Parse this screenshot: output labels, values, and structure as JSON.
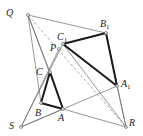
{
  "diagram": {
    "points": {
      "Q": {
        "label": "Q",
        "sub": "",
        "x": 28,
        "y": 15,
        "lx": 6,
        "ly": 16
      },
      "P": {
        "label": "P",
        "sub": "",
        "x": 59,
        "y": 49,
        "lx": 50,
        "ly": 51
      },
      "C1": {
        "label": "C",
        "sub": "1",
        "x": 63,
        "y": 44,
        "lx": 57,
        "ly": 40
      },
      "B1": {
        "label": "B",
        "sub": "1",
        "x": 106,
        "y": 33,
        "lx": 100,
        "ly": 27
      },
      "A1": {
        "label": "A",
        "sub": "1",
        "x": 117,
        "y": 86,
        "lx": 121,
        "ly": 87
      },
      "C": {
        "label": "C",
        "sub": "",
        "x": 50,
        "y": 72,
        "lx": 36,
        "ly": 75
      },
      "B": {
        "label": "B",
        "sub": "",
        "x": 41,
        "y": 103,
        "lx": 35,
        "ly": 116
      },
      "A": {
        "label": "A",
        "sub": "",
        "x": 63,
        "y": 109,
        "lx": 58,
        "ly": 121
      },
      "S": {
        "label": "S",
        "sub": "",
        "x": 21,
        "y": 127,
        "lx": 9,
        "ly": 129
      },
      "R": {
        "label": "R",
        "sub": "",
        "x": 126,
        "y": 127,
        "lx": 129,
        "ly": 126
      }
    },
    "thin_lines": [
      [
        "Q",
        "B1"
      ],
      [
        "Q",
        "C"
      ],
      [
        "Q",
        "B"
      ],
      [
        "Q",
        "A"
      ],
      [
        "S",
        "P"
      ],
      [
        "S",
        "C1"
      ],
      [
        "S",
        "A1"
      ],
      [
        "S",
        "A"
      ],
      [
        "R",
        "A"
      ],
      [
        "R",
        "A1"
      ],
      [
        "R",
        "C1"
      ],
      [
        "R",
        "B1"
      ]
    ],
    "dashed_lines": [
      [
        "Q",
        "R"
      ]
    ],
    "thick_triangles": [
      [
        "A",
        "B",
        "C"
      ],
      [
        "A1",
        "B1",
        "C1"
      ]
    ],
    "colors": {
      "thick": "#1a1a1a",
      "thin": "#6a6a6a",
      "dashed": "#8a8a8a"
    }
  }
}
